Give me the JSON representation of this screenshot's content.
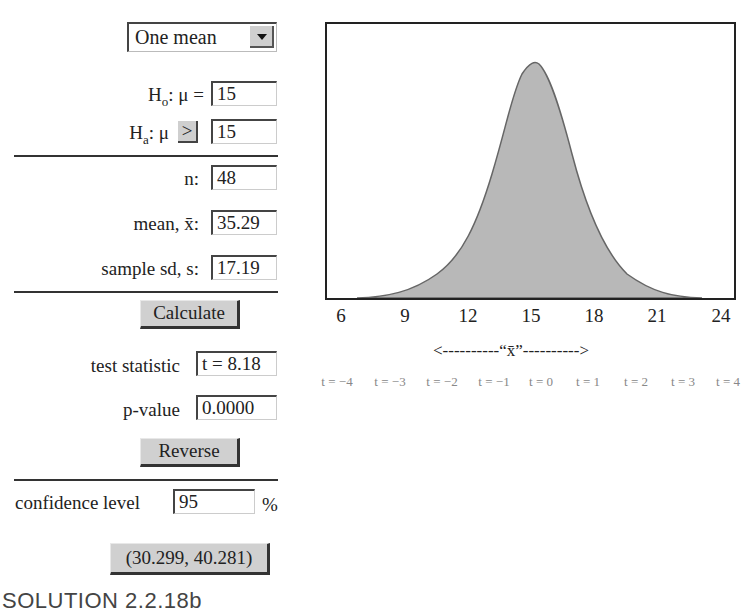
{
  "controls": {
    "test_type": "One mean",
    "h0_label": "Hₒ: μ =",
    "h0_value": "15",
    "ha_label": "Hₐ: μ",
    "ha_relation": ">",
    "ha_value": "15",
    "n_label": "n:",
    "n_value": "48",
    "mean_label": "mean, x̄:",
    "mean_value": "35.29",
    "sd_label": "sample sd, s:",
    "sd_value": "17.19",
    "calculate_label": "Calculate",
    "test_stat_label": "test statistic",
    "test_stat_value": "t = 8.18",
    "pvalue_label": "p-value",
    "pvalue_value": "0.0000",
    "reverse_label": "Reverse",
    "conf_label": "confidence level",
    "conf_value": "95",
    "conf_unit": "%",
    "interval_label": "(30.299, 40.281)"
  },
  "plot": {
    "x_ticks": [
      "6",
      "9",
      "12",
      "15",
      "18",
      "21",
      "24"
    ],
    "x_axis_label": "<----------“x̄”---------->",
    "t_labels": [
      "t = −4",
      "t = −3",
      "t = −2",
      "t = −1",
      "t = 0",
      "t = 1",
      "t = 2",
      "t = 3",
      "t = 4"
    ],
    "fill_color": "#b8b8b8",
    "curve_color": "#666666"
  },
  "footer": {
    "caption": "SOLUTION 2.2.18b"
  }
}
